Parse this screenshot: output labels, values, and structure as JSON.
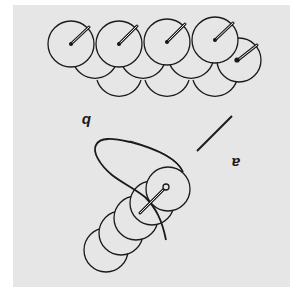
{
  "figure": {
    "orientation": "rotated 180 degrees",
    "background_color": "#e6e6e6",
    "stroke_color": "#1a1a1a",
    "labels": {
      "a": "a",
      "b": "b"
    },
    "panel_a": {
      "description": "Needle threaded through a stack of sequins with a loop of thread"
    },
    "panel_b": {
      "description": "Row of overlapping sequins with needles shown at each centre hole"
    }
  }
}
